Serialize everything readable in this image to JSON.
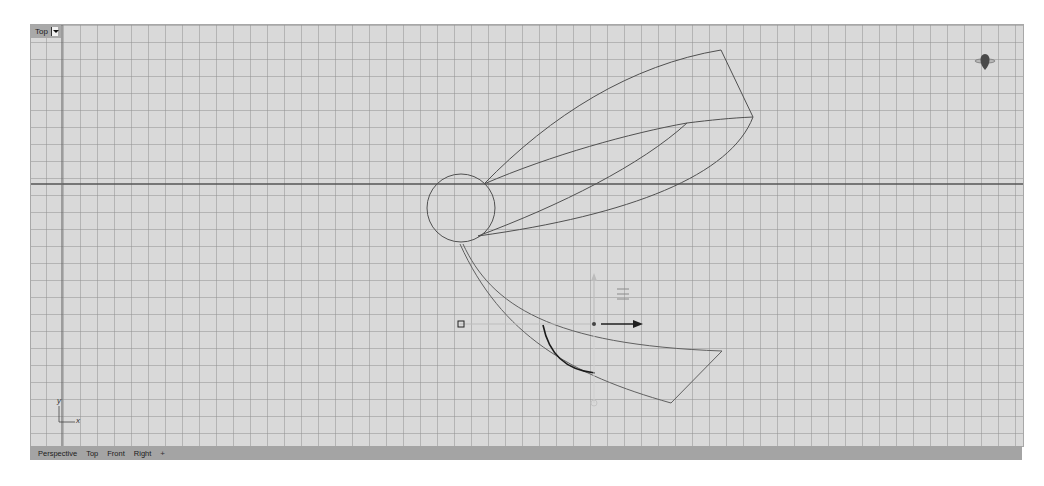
{
  "viewport": {
    "title": "Top",
    "background_color": "#d9d9d9",
    "grid_color": "#8e8e8e",
    "axis_line_color": "#555555",
    "curve_color": "#505050",
    "selected_curve_color": "#1a1a1a"
  },
  "axis_indicator": {
    "x_label": "x",
    "y_label": "y"
  },
  "navigation_widget": {
    "icon": "view-cube-compass-icon"
  },
  "gumball": {
    "icon": "gumball-transform-icon",
    "menu_icon": "gumball-menu-icon"
  },
  "statusbar": {
    "tabs": [
      {
        "label": "Perspective"
      },
      {
        "label": "Top"
      },
      {
        "label": "Front"
      },
      {
        "label": "Right"
      }
    ],
    "add_label": "+"
  }
}
